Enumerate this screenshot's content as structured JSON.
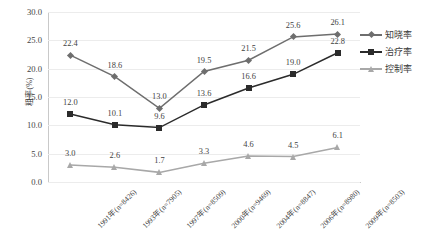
{
  "chart_data": {
    "type": "line",
    "title": "",
    "xlabel": "",
    "ylabel": "粗率(%)",
    "ylim": [
      0,
      30
    ],
    "ytick_step": 5,
    "yticks": [
      "0.0",
      "5.0",
      "10.0",
      "15.0",
      "20.0",
      "25.0",
      "30.0"
    ],
    "grid": true,
    "legend_position": "right",
    "categories": [
      "1991年(n=8426)",
      "1993年(n=7905)",
      "1997年(n=8509)",
      "2000年(n=9469)",
      "2004年(n=8847)",
      "2006年(n=8980)",
      "2009年(n=8503)"
    ],
    "series": [
      {
        "name": "知晓率",
        "marker": "diamond",
        "color": "#6e6e6e",
        "values": [
          22.4,
          18.6,
          13.0,
          19.5,
          21.5,
          25.6,
          26.1
        ],
        "labels": [
          "22.4",
          "18.6",
          "13.0",
          "19.5",
          "21.5",
          "25.6",
          "26.1"
        ]
      },
      {
        "name": "治疗率",
        "marker": "square",
        "color": "#2b2b2b",
        "values": [
          12.0,
          10.1,
          9.6,
          13.6,
          16.6,
          19.0,
          22.8
        ],
        "labels": [
          "12.0",
          "10.1",
          "9.6",
          "13.6",
          "16.6",
          "19.0",
          "22.8"
        ]
      },
      {
        "name": "控制率",
        "marker": "triangle",
        "color": "#a8a8a8",
        "values": [
          3.0,
          2.6,
          1.7,
          3.3,
          4.6,
          4.5,
          6.1
        ],
        "labels": [
          "3.0",
          "2.6",
          "1.7",
          "3.3",
          "4.6",
          "4.5",
          "6.1"
        ]
      }
    ]
  },
  "legend": {
    "items": [
      {
        "label": "知晓率"
      },
      {
        "label": "治疗率"
      },
      {
        "label": "控制率"
      }
    ]
  }
}
